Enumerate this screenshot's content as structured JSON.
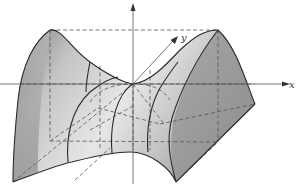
{
  "figure": {
    "axes": {
      "x_label": "x",
      "y_label": "y",
      "z_label": ""
    },
    "colors": {
      "surface_light": "#f4f4f4",
      "surface_mid": "#bdbdbd",
      "surface_dark": "#8a8a8a",
      "right_face": "#9c9c9c",
      "edge": "#2a2a2a",
      "dashed": "#555555"
    }
  }
}
